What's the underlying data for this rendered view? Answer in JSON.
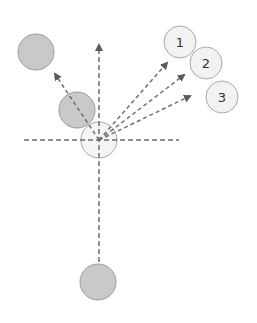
{
  "diagram": {
    "colors": {
      "dash": "#6e6e6e",
      "filled_circle": "#c9c9c9",
      "filled_border": "#9b9b9b",
      "light_circle": "#f2f2f2",
      "light_border": "#a8a8a8"
    },
    "axes": {
      "horizontal": {
        "x1": 24,
        "y1": 140,
        "x2": 179,
        "y2": 140
      },
      "vertical": {
        "x1": 99,
        "y1": 262,
        "x2": 99,
        "y2": 45,
        "arrow": true
      }
    },
    "center_circle": {
      "cx": 99,
      "cy": 140,
      "r": 18
    },
    "gray_circles": [
      {
        "id": "top-left",
        "cx": 36,
        "cy": 52,
        "r": 18
      },
      {
        "id": "mid-left",
        "cx": 77,
        "cy": 110,
        "r": 18
      },
      {
        "id": "bottom",
        "cx": 98,
        "cy": 282,
        "r": 18
      }
    ],
    "numbered_circles": [
      {
        "label": "1",
        "cx": 180,
        "cy": 42,
        "r": 16
      },
      {
        "label": "2",
        "cx": 206,
        "cy": 63,
        "r": 16
      },
      {
        "label": "3",
        "cx": 222,
        "cy": 97,
        "r": 16
      }
    ],
    "arrows": [
      {
        "id": "to-top-left",
        "x1": 99,
        "y1": 140,
        "x2": 55,
        "y2": 74
      },
      {
        "id": "to-1",
        "x1": 99,
        "y1": 140,
        "x2": 167,
        "y2": 63
      },
      {
        "id": "to-2",
        "x1": 99,
        "y1": 140,
        "x2": 184,
        "y2": 75
      },
      {
        "id": "to-3",
        "x1": 99,
        "y1": 140,
        "x2": 190,
        "y2": 96
      }
    ]
  }
}
